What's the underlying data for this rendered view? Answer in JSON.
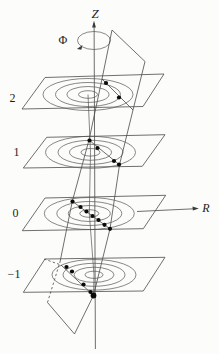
{
  "diagram": {
    "axes": {
      "vertical_label": "Z",
      "azimuthal_label": "Φ",
      "radial_label": "R"
    },
    "levels": [
      {
        "label": "2"
      },
      {
        "label": "1"
      },
      {
        "label": "0"
      },
      {
        "label": "−1"
      }
    ],
    "planes": [
      {
        "level_label": "2",
        "contour_count": 4,
        "dot_count": 2
      },
      {
        "level_label": "1",
        "contour_count": 4,
        "dot_count": 4
      },
      {
        "level_label": "0",
        "contour_count": 4,
        "dot_count": 7
      },
      {
        "level_label": "−1",
        "contour_count": 4,
        "dot_count": 5
      }
    ],
    "colors": {
      "background": "#fcfcfa",
      "line": "#4a4a4a",
      "dot": "#0a0a0a",
      "label": "#1c1c1c"
    }
  }
}
